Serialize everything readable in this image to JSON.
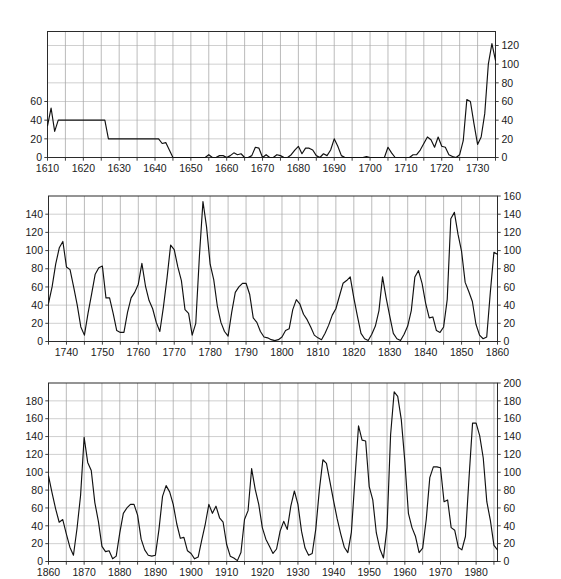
{
  "figure": {
    "title": "",
    "background_color": "#ffffff",
    "line_color": "#111111",
    "grid_color": "#8d8d8d",
    "axis_color": "#2b2b2b",
    "panel_count": 3
  },
  "chart_data": [
    {
      "type": "line",
      "panel": 1,
      "title": "",
      "xlabel": "",
      "ylabel": "",
      "xlim": [
        1610,
        1735
      ],
      "ylim": [
        0,
        135
      ],
      "grid": true,
      "legend": "none",
      "x_ticks": [
        1610,
        1620,
        1630,
        1640,
        1650,
        1660,
        1670,
        1680,
        1690,
        1700,
        1710,
        1720,
        1730
      ],
      "x_tick_labels": [
        "1610",
        "1620",
        "1630",
        "1640",
        "1650",
        "1660",
        "1670",
        "1680",
        "1690",
        "1700",
        "1710",
        "1720",
        "1730"
      ],
      "x_minor_step": 5,
      "y_ticks_left": [
        0,
        20,
        40,
        60
      ],
      "y_tick_labels_left": [
        "0",
        "20",
        "40",
        "60"
      ],
      "y_ticks_right": [
        0,
        20,
        40,
        60,
        80,
        100,
        120
      ],
      "y_tick_labels_right": [
        "0",
        "20",
        "40",
        "60",
        "80",
        "100",
        "120"
      ],
      "y_grid_step": 20,
      "x": [
        1610,
        1611,
        1612,
        1613,
        1614,
        1615,
        1616,
        1617,
        1618,
        1619,
        1620,
        1621,
        1622,
        1623,
        1624,
        1625,
        1626,
        1627,
        1628,
        1629,
        1630,
        1631,
        1632,
        1633,
        1634,
        1635,
        1636,
        1637,
        1638,
        1639,
        1640,
        1641,
        1642,
        1643,
        1644,
        1645,
        1646,
        1647,
        1648,
        1649,
        1650,
        1651,
        1652,
        1653,
        1654,
        1655,
        1656,
        1657,
        1658,
        1659,
        1660,
        1661,
        1662,
        1663,
        1664,
        1665,
        1666,
        1667,
        1668,
        1669,
        1670,
        1671,
        1672,
        1673,
        1674,
        1675,
        1676,
        1677,
        1678,
        1679,
        1680,
        1681,
        1682,
        1683,
        1684,
        1685,
        1686,
        1687,
        1688,
        1689,
        1690,
        1691,
        1692,
        1693,
        1694,
        1695,
        1696,
        1697,
        1698,
        1699,
        1700,
        1701,
        1702,
        1703,
        1704,
        1705,
        1706,
        1707,
        1708,
        1709,
        1710,
        1711,
        1712,
        1713,
        1714,
        1715,
        1716,
        1717,
        1718,
        1719,
        1720,
        1721,
        1722,
        1723,
        1724,
        1725,
        1726,
        1727,
        1728,
        1729,
        1730,
        1731,
        1732,
        1733,
        1734,
        1735
      ],
      "y": [
        34,
        53,
        28,
        40,
        40,
        40,
        40,
        40,
        40,
        40,
        40,
        40,
        40,
        40,
        40,
        40,
        40,
        20,
        20,
        20,
        20,
        20,
        20,
        20,
        20,
        20,
        20,
        20,
        20,
        20,
        20,
        20,
        15,
        16,
        8,
        0,
        0,
        0,
        0,
        0,
        0,
        0,
        0,
        0,
        0,
        3,
        0,
        0,
        2,
        2,
        0,
        2,
        5,
        3,
        4,
        0,
        0,
        2,
        11,
        10,
        0,
        3,
        0,
        0,
        3,
        2,
        0,
        0,
        3,
        8,
        12,
        4,
        10,
        10,
        8,
        2,
        0,
        4,
        2,
        8,
        20,
        12,
        2,
        0,
        0,
        0,
        0,
        0,
        0,
        1,
        0,
        0,
        0,
        0,
        0,
        11,
        5,
        0,
        0,
        0,
        0,
        0,
        3,
        3,
        8,
        15,
        22,
        19,
        11,
        22,
        12,
        11,
        3,
        1,
        0,
        3,
        18,
        62,
        60,
        36,
        14,
        22,
        47,
        100,
        122,
        104,
        65,
        41,
        36,
        40
      ]
    },
    {
      "type": "line",
      "panel": 2,
      "title": "",
      "xlabel": "",
      "ylabel": "",
      "xlim": [
        1735,
        1860
      ],
      "ylim": [
        0,
        160
      ],
      "grid": true,
      "legend": "none",
      "x_ticks": [
        1740,
        1750,
        1760,
        1770,
        1780,
        1790,
        1800,
        1810,
        1820,
        1830,
        1840,
        1850,
        1860
      ],
      "x_tick_labels": [
        "1740",
        "1750",
        "1760",
        "1770",
        "1780",
        "1790",
        "1800",
        "1810",
        "1820",
        "1830",
        "1840",
        "1850",
        "1860"
      ],
      "x_minor_step": 5,
      "y_ticks_left": [
        0,
        20,
        40,
        60,
        80,
        100,
        120,
        140
      ],
      "y_tick_labels_left": [
        "0",
        "20",
        "40",
        "60",
        "80",
        "100",
        "120",
        "140"
      ],
      "y_ticks_right": [
        0,
        20,
        40,
        60,
        80,
        100,
        120,
        140,
        160
      ],
      "y_tick_labels_right": [
        "0",
        "20",
        "40",
        "60",
        "80",
        "100",
        "120",
        "140",
        "160"
      ],
      "y_grid_step": 20,
      "x": [
        1735,
        1736,
        1737,
        1738,
        1739,
        1740,
        1741,
        1742,
        1743,
        1744,
        1745,
        1746,
        1747,
        1748,
        1749,
        1750,
        1751,
        1752,
        1753,
        1754,
        1755,
        1756,
        1757,
        1758,
        1759,
        1760,
        1761,
        1762,
        1763,
        1764,
        1765,
        1766,
        1767,
        1768,
        1769,
        1770,
        1771,
        1772,
        1773,
        1774,
        1775,
        1776,
        1777,
        1778,
        1779,
        1780,
        1781,
        1782,
        1783,
        1784,
        1785,
        1786,
        1787,
        1788,
        1789,
        1790,
        1791,
        1792,
        1793,
        1794,
        1795,
        1796,
        1797,
        1798,
        1799,
        1800,
        1801,
        1802,
        1803,
        1804,
        1805,
        1806,
        1807,
        1808,
        1809,
        1810,
        1811,
        1812,
        1813,
        1814,
        1815,
        1816,
        1817,
        1818,
        1819,
        1820,
        1821,
        1822,
        1823,
        1824,
        1825,
        1826,
        1827,
        1828,
        1829,
        1830,
        1831,
        1832,
        1833,
        1834,
        1835,
        1836,
        1837,
        1838,
        1839,
        1840,
        1841,
        1842,
        1843,
        1844,
        1845,
        1846,
        1847,
        1848,
        1849,
        1850,
        1851,
        1852,
        1853,
        1854,
        1855,
        1856,
        1857,
        1858,
        1859,
        1860
      ],
      "y": [
        42,
        60,
        85,
        103,
        110,
        82,
        79,
        60,
        40,
        16,
        7,
        31,
        52,
        74,
        81,
        83,
        48,
        48,
        31,
        12,
        10,
        10,
        32,
        48,
        54,
        63,
        86,
        61,
        45,
        36,
        21,
        11,
        38,
        70,
        106,
        101,
        82,
        67,
        35,
        31,
        7,
        20,
        93,
        154,
        126,
        85,
        68,
        39,
        21,
        11,
        6,
        32,
        54,
        60,
        64,
        64,
        52,
        26,
        21,
        11,
        5,
        4,
        2,
        1,
        2,
        5,
        12,
        14,
        35,
        46,
        41,
        30,
        24,
        16,
        7,
        4,
        2,
        9,
        18,
        29,
        36,
        50,
        64,
        67,
        71,
        48,
        28,
        9,
        3,
        1,
        8,
        17,
        34,
        71,
        48,
        28,
        9,
        3,
        1,
        8,
        17,
        34,
        71,
        78,
        64,
        42,
        26,
        27,
        12,
        10,
        16,
        46,
        135,
        142,
        118,
        99,
        65,
        55,
        44,
        19,
        7,
        3,
        5,
        54,
        98,
        96
      ]
    },
    {
      "type": "line",
      "panel": 3,
      "title": "",
      "xlabel": "",
      "ylabel": "",
      "xlim": [
        1860,
        1986
      ],
      "ylim": [
        0,
        200
      ],
      "grid": true,
      "legend": "none",
      "x_ticks": [
        1860,
        1870,
        1880,
        1890,
        1900,
        1910,
        1920,
        1930,
        1940,
        1950,
        1960,
        1970,
        1980
      ],
      "x_tick_labels": [
        "1860",
        "1870",
        "1880",
        "1890",
        "1900",
        "1910",
        "1920",
        "1930",
        "1940",
        "1950",
        "1960",
        "1970",
        "1980"
      ],
      "x_minor_step": 5,
      "y_ticks_left": [
        0,
        20,
        40,
        60,
        80,
        100,
        120,
        140,
        160,
        180
      ],
      "y_tick_labels_left": [
        "0",
        "20",
        "40",
        "60",
        "80",
        "100",
        "120",
        "140",
        "160",
        "180"
      ],
      "y_ticks_right": [
        0,
        20,
        40,
        60,
        80,
        100,
        120,
        140,
        160,
        180,
        200
      ],
      "y_tick_labels_right": [
        "0",
        "20",
        "40",
        "60",
        "80",
        "100",
        "120",
        "140",
        "160",
        "180",
        "200"
      ],
      "y_grid_step": 20,
      "x": [
        1860,
        1861,
        1862,
        1863,
        1864,
        1865,
        1866,
        1867,
        1868,
        1869,
        1870,
        1871,
        1872,
        1873,
        1874,
        1875,
        1876,
        1877,
        1878,
        1879,
        1880,
        1881,
        1882,
        1883,
        1884,
        1885,
        1886,
        1887,
        1888,
        1889,
        1890,
        1891,
        1892,
        1893,
        1894,
        1895,
        1896,
        1897,
        1898,
        1899,
        1900,
        1901,
        1902,
        1903,
        1904,
        1905,
        1906,
        1907,
        1908,
        1909,
        1910,
        1911,
        1912,
        1913,
        1914,
        1915,
        1916,
        1917,
        1918,
        1919,
        1920,
        1921,
        1922,
        1923,
        1924,
        1925,
        1926,
        1927,
        1928,
        1929,
        1930,
        1931,
        1932,
        1933,
        1934,
        1935,
        1936,
        1937,
        1938,
        1939,
        1940,
        1941,
        1942,
        1943,
        1944,
        1945,
        1946,
        1947,
        1948,
        1949,
        1950,
        1951,
        1952,
        1953,
        1954,
        1955,
        1956,
        1957,
        1958,
        1959,
        1960,
        1961,
        1962,
        1963,
        1964,
        1965,
        1966,
        1967,
        1968,
        1969,
        1970,
        1971,
        1972,
        1973,
        1974,
        1975,
        1976,
        1977,
        1978,
        1979,
        1980,
        1981,
        1982,
        1983,
        1984,
        1985,
        1986
      ],
      "y": [
        96,
        77,
        59,
        44,
        47,
        31,
        16,
        7,
        37,
        74,
        139,
        111,
        102,
        66,
        45,
        17,
        11,
        12,
        3,
        6,
        32,
        54,
        60,
        64,
        64,
        52,
        25,
        13,
        7,
        6,
        7,
        36,
        73,
        85,
        78,
        64,
        42,
        26,
        27,
        12,
        9,
        3,
        5,
        24,
        42,
        64,
        54,
        62,
        49,
        44,
        19,
        6,
        4,
        1,
        10,
        47,
        57,
        104,
        81,
        64,
        38,
        25,
        17,
        9,
        14,
        34,
        45,
        36,
        62,
        79,
        64,
        34,
        15,
        7,
        9,
        36,
        80,
        114,
        110,
        89,
        68,
        48,
        31,
        16,
        10,
        33,
        93,
        152,
        136,
        135,
        84,
        69,
        32,
        14,
        4,
        38,
        142,
        190,
        185,
        159,
        112,
        54,
        38,
        28,
        10,
        15,
        47,
        94,
        106,
        106,
        105,
        67,
        69,
        38,
        35,
        16,
        13,
        28,
        93,
        155,
        155,
        141,
        116,
        67,
        46,
        18,
        13
      ]
    }
  ]
}
